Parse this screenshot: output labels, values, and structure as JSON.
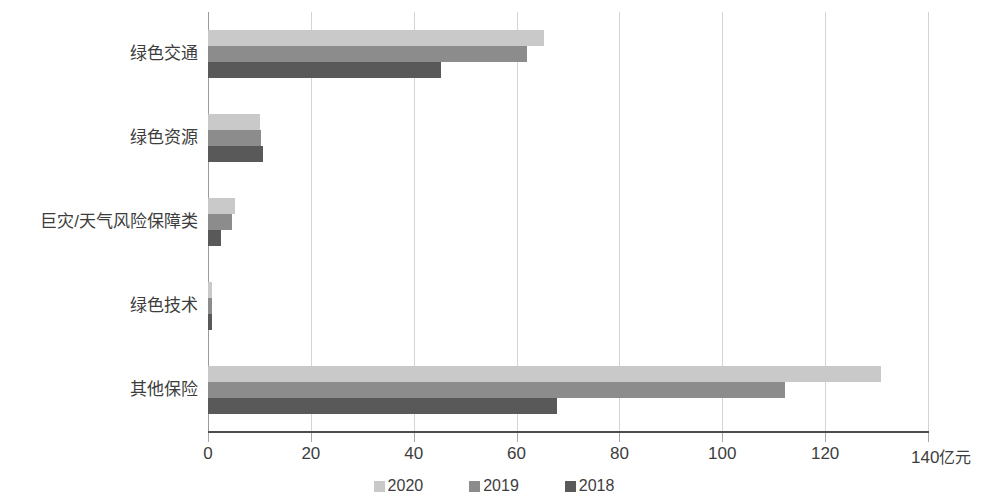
{
  "chart_data": {
    "type": "bar",
    "orientation": "horizontal",
    "title": "",
    "subtitle": "",
    "xlabel": "亿元",
    "ylabel": "",
    "xlim": [
      0,
      140
    ],
    "xticks": [
      0,
      20,
      40,
      60,
      80,
      100,
      120,
      140
    ],
    "xtick_labels": [
      "0",
      "20",
      "40",
      "60",
      "80",
      "100",
      "120",
      "140"
    ],
    "unit_suffix": "亿元",
    "grid": true,
    "grid_axis": "x",
    "legend_position": "bottom",
    "categories": [
      "绿色交通",
      "绿色资源",
      "巨灾/天气风险保障类",
      "绿色技术",
      "其他保险"
    ],
    "series": [
      {
        "name": "2020",
        "color": "#c9c9c9",
        "values": [
          65.4,
          10.1,
          5.2,
          0.8,
          130.9
        ]
      },
      {
        "name": "2019",
        "color": "#8c8c8c",
        "values": [
          62.0,
          10.3,
          4.6,
          0.8,
          112.2
        ]
      },
      {
        "name": "2018",
        "color": "#595959",
        "values": [
          45.4,
          10.7,
          2.5,
          0.7,
          67.8
        ]
      }
    ]
  },
  "axis": {
    "tick_color": "#a8a8a8",
    "line_color": "#4d4d4d",
    "gridline_color": "#d4d4d4"
  },
  "legend": {
    "items": [
      {
        "label": "2020",
        "color": "#c9c9c9",
        "swatch": "square-swatch-2020"
      },
      {
        "label": "2019",
        "color": "#8c8c8c",
        "swatch": "square-swatch-2019"
      },
      {
        "label": "2018",
        "color": "#595959",
        "swatch": "square-swatch-2018"
      }
    ]
  }
}
